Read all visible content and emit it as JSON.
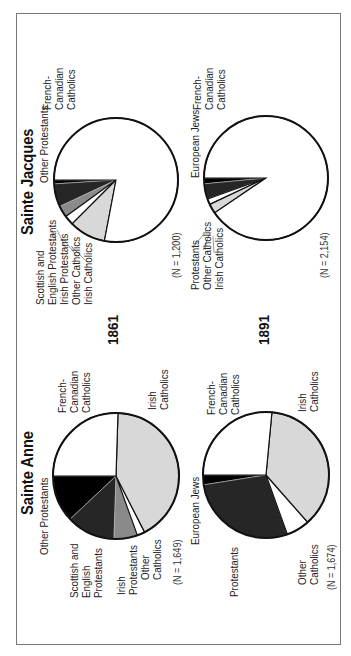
{
  "orientation": "rotated-90-ccw",
  "panels": {
    "sainte_anne": {
      "title": "Sainte Anne",
      "y1861": {
        "n_label": "(N = 1,649)",
        "labels": {
          "french_canadian": "French-\nCanadian\nCatholics",
          "irish_catholics": "Irish\nCatholics",
          "other_protestants": "Other Protestants",
          "scottish_english": "Scottish and\nEnglish\nProtestants",
          "irish_protestants": "Irish\nProtestants",
          "other_catholics": "Other\nCatholics"
        }
      },
      "y1891": {
        "n_label": "(N = 1,674)",
        "labels": {
          "french_canadian": "French-\nCanadian\nCatholics",
          "irish_catholics": "Irish\nCatholics",
          "european_jews": "European Jews",
          "protestants": "Protestants",
          "other_catholics": "Other\nCatholics"
        }
      }
    },
    "sainte_jacques": {
      "title": "Sainte Jacques",
      "y1861": {
        "n_label": "(N = 1,200)",
        "labels": {
          "french_canadian": "French-\nCanadian\nCatholics",
          "other_protestants": "Other Protestants",
          "stack": "Scottish and\nEnglish Protestants\nIrish Protestants\nOther Catholics\nIrish Catholics"
        }
      },
      "y1891": {
        "n_label": "(N = 2,154)",
        "labels": {
          "french_canadian": "French-\nCanadian\nCatholics",
          "european_jews": "European Jews",
          "stack": "Protestants\nOther Catholics\nIrish Catholics"
        }
      }
    }
  },
  "years": {
    "first": "1861",
    "second": "1891"
  },
  "colors": {
    "french_canadian": "#ffffff",
    "irish_catholics": "#d8d8d8",
    "other_catholics": "#ffffff",
    "irish_protestants": "#8a8a8a",
    "scottish_english": "#262626",
    "protestants": "#262626",
    "other_protestants": "#000000",
    "european_jews": "#000000",
    "outline": "#111111"
  },
  "chart_data": [
    {
      "type": "pie",
      "title": "Sainte Anne 1861",
      "n": 1649,
      "categories": [
        "Other Protestants",
        "Scottish and English Protestants",
        "Irish Protestants",
        "Other Catholics",
        "Irish Catholics",
        "French-Canadian Catholics"
      ],
      "values": [
        12,
        12.5,
        6,
        2,
        42,
        25.5
      ],
      "unit": "percent (estimated)"
    },
    {
      "type": "pie",
      "title": "Sainte Anne 1891",
      "n": 1674,
      "categories": [
        "European Jews",
        "Protestants",
        "Other Catholics",
        "Irish Catholics",
        "French-Canadian Catholics"
      ],
      "values": [
        2.5,
        28,
        6,
        37,
        26.5
      ],
      "unit": "percent (estimated)"
    },
    {
      "type": "pie",
      "title": "Sainte Jacques 1861",
      "n": 1200,
      "categories": [
        "Other Protestants",
        "Scottish and English Protestants",
        "Irish Protestants",
        "Other Catholics",
        "Irish Catholics",
        "French-Canadian Catholics"
      ],
      "values": [
        1,
        6,
        3,
        2.5,
        9.5,
        78
      ],
      "unit": "percent (estimated)"
    },
    {
      "type": "pie",
      "title": "Sainte Jacques 1891",
      "n": 2154,
      "categories": [
        "European Jews",
        "Protestants",
        "Other Catholics",
        "Irish Catholics",
        "French-Canadian Catholics"
      ],
      "values": [
        1.5,
        4,
        1.5,
        2.5,
        90.5
      ],
      "unit": "percent (estimated)"
    }
  ]
}
